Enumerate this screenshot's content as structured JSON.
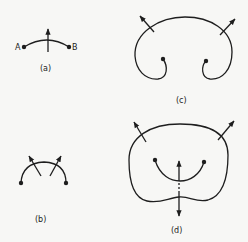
{
  "figure": {
    "panels": [
      {
        "id": "a",
        "caption": "(a)",
        "endpoints": [
          "A",
          "B"
        ]
      },
      {
        "id": "b",
        "caption": "(b)"
      },
      {
        "id": "c",
        "caption": "(c)"
      },
      {
        "id": "d",
        "caption": "(d)"
      }
    ],
    "colors": {
      "ink": "#1e1e1e",
      "paper": "#f7f7f5"
    }
  }
}
